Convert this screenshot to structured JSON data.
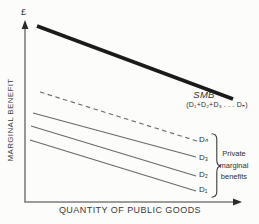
{
  "figure": {
    "y_axis_unit": "£",
    "y_axis_label": "MARGINAL BENEFIT",
    "x_axis_label": "QUANTITY OF PUBLIC GOODS",
    "smb_label": "SMB",
    "smb_formula": "(D₁+D₂+D₃ . . . Dₙ)",
    "brace_label_lines": [
      "Private",
      "marginal",
      "benefits"
    ],
    "curve_labels": {
      "dn": "Dₙ",
      "d3": "D₃",
      "d2": "D₂",
      "d1": "D₁"
    }
  },
  "colors": {
    "background": "#fcfcfa",
    "axis": "#7d7d7d",
    "arrowhead": "#2a2a2a",
    "smb_line": "#1b1b1b",
    "thin_line": "#686868",
    "brace": "#3a3a3a",
    "text": "#2f2f2f"
  },
  "chart_data": {
    "type": "line",
    "title": "",
    "xlabel": "QUANTITY OF PUBLIC GOODS",
    "ylabel": "MARGINAL BENEFIT (£)",
    "axes_numeric": false,
    "grid": false,
    "legend_position": "on-curve-right",
    "series": [
      {
        "key": "smb",
        "name": "SMB (D₁+D₂+D₃ . . . Dₙ)",
        "role": "social-marginal-benefit",
        "style": "thick-solid",
        "points_px": [
          [
            37,
            26
          ],
          [
            233,
            99
          ]
        ]
      },
      {
        "key": "dn",
        "name": "Dₙ",
        "role": "private-marginal-benefit",
        "style": "dashed",
        "points_px": [
          [
            40,
            92
          ],
          [
            197,
            141
          ]
        ]
      },
      {
        "key": "d3",
        "name": "D₃",
        "role": "private-marginal-benefit",
        "style": "solid",
        "points_px": [
          [
            33,
            113
          ],
          [
            196,
            157
          ]
        ]
      },
      {
        "key": "d2",
        "name": "D₂",
        "role": "private-marginal-benefit",
        "style": "solid",
        "points_px": [
          [
            31,
            126
          ],
          [
            196,
            176
          ]
        ]
      },
      {
        "key": "d1",
        "name": "D₁",
        "role": "private-marginal-benefit",
        "style": "solid",
        "points_px": [
          [
            30,
            140
          ],
          [
            196,
            191
          ]
        ]
      }
    ],
    "annotations": [
      {
        "text": "Private marginal benefits",
        "targets": [
          "Dₙ",
          "D₃",
          "D₂",
          "D₁"
        ],
        "marker": "right-curly-brace"
      }
    ]
  }
}
